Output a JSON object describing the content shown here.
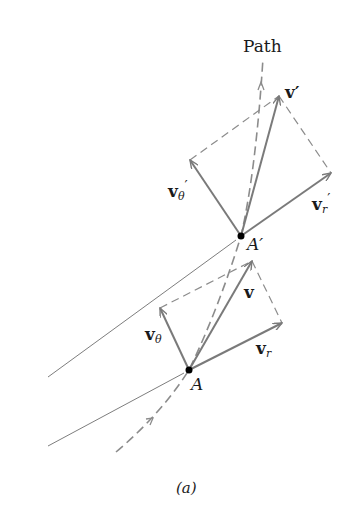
{
  "figure": {
    "caption": "(a)",
    "path_label": "Path",
    "points": {
      "A": {
        "label": "A",
        "x": 189,
        "y": 370
      },
      "A_prime": {
        "label": "A′",
        "x": 241,
        "y": 236
      }
    },
    "vectors_at_A": {
      "v": {
        "label": "v",
        "tip": [
          252,
          261
        ]
      },
      "v_r": {
        "label": "v",
        "sub": "r",
        "tip": [
          282,
          323
        ]
      },
      "v_theta": {
        "label": "v",
        "sub": "θ",
        "tip": [
          160,
          308
        ]
      }
    },
    "vectors_at_A_prime": {
      "v": {
        "label": "v′",
        "tip": [
          279,
          96
        ]
      },
      "v_r": {
        "label": "v",
        "sub": "r",
        "prime": "′",
        "tip": [
          331,
          173
        ]
      },
      "v_theta": {
        "label": "v",
        "sub": "θ",
        "prime": "′",
        "tip": [
          190,
          160
        ]
      }
    },
    "colors": {
      "vector": "#7a7a7a",
      "dashed": "#8c8c8c",
      "thin_line": "#6e6e6e",
      "point": "#000000",
      "text": "#1a1a1a"
    }
  }
}
